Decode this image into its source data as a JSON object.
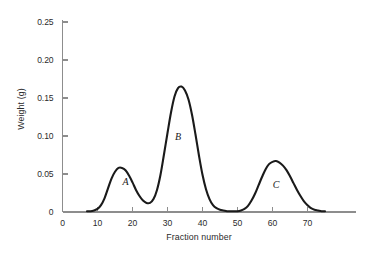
{
  "chart_data": {
    "type": "line",
    "title": "",
    "subtitle": "",
    "xlabel": "Fraction number",
    "ylabel": "Weight (g)",
    "xlim": [
      0,
      78
    ],
    "ylim": [
      0,
      0.25
    ],
    "grid": false,
    "legend": null,
    "xticks": [
      0,
      10,
      20,
      30,
      40,
      50,
      60,
      70
    ],
    "xtick_labels": [
      "0",
      "10",
      "20",
      "30",
      "40",
      "50",
      "60",
      "70"
    ],
    "yticks": [
      0,
      0.05,
      0.1,
      0.15,
      0.2,
      0.25
    ],
    "ytick_labels": [
      "0",
      "0.05",
      "0.10",
      "0.15",
      "0.20",
      "0.25"
    ],
    "annotations": [
      {
        "text": "A",
        "x": 18,
        "y": 0.035
      },
      {
        "text": "B",
        "x": 33,
        "y": 0.095
      },
      {
        "text": "C",
        "x": 61,
        "y": 0.032
      }
    ],
    "series": [
      {
        "name": "elution profile",
        "color": "#1a1a1a",
        "x": [
          7,
          8,
          9,
          10,
          11,
          12,
          13,
          14,
          15,
          16,
          17,
          18,
          19,
          20,
          21,
          22,
          23,
          24,
          25,
          26,
          27,
          28,
          29,
          30,
          31,
          32,
          33,
          34,
          35,
          36,
          37,
          38,
          39,
          40,
          41,
          42,
          43,
          44,
          45,
          46,
          47,
          48,
          49,
          50,
          51,
          52,
          53,
          54,
          55,
          56,
          57,
          58,
          59,
          60,
          61,
          62,
          63,
          64,
          65,
          66,
          67,
          68,
          69,
          70,
          71,
          72,
          73,
          74,
          75
        ],
        "y": [
          0.001,
          0.001,
          0.002,
          0.004,
          0.009,
          0.018,
          0.031,
          0.044,
          0.053,
          0.058,
          0.058,
          0.055,
          0.048,
          0.039,
          0.029,
          0.021,
          0.015,
          0.012,
          0.012,
          0.017,
          0.029,
          0.049,
          0.076,
          0.104,
          0.131,
          0.152,
          0.163,
          0.165,
          0.16,
          0.148,
          0.128,
          0.102,
          0.074,
          0.049,
          0.03,
          0.017,
          0.009,
          0.005,
          0.003,
          0.002,
          0.001,
          0.001,
          0.001,
          0.001,
          0.002,
          0.004,
          0.008,
          0.015,
          0.024,
          0.035,
          0.046,
          0.056,
          0.063,
          0.066,
          0.067,
          0.065,
          0.061,
          0.055,
          0.047,
          0.038,
          0.029,
          0.021,
          0.014,
          0.009,
          0.005,
          0.003,
          0.002,
          0.001,
          0.001
        ]
      }
    ],
    "peaks": [
      {
        "label": "A",
        "center_fraction": 16,
        "max_weight_g": 0.058
      },
      {
        "label": "B",
        "center_fraction": 34,
        "max_weight_g": 0.165
      },
      {
        "label": "C",
        "center_fraction": 61,
        "max_weight_g": 0.067
      }
    ]
  }
}
